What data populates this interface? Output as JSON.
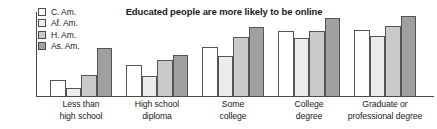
{
  "chart_data": {
    "type": "bar",
    "title": "Educated people are more likely to be online",
    "xlabel": "",
    "ylabel": "",
    "ylim": [
      0,
      80
    ],
    "yticks": [
      0,
      20,
      40,
      60,
      80
    ],
    "ytick_labels": [
      "0",
      "20",
      "40",
      "60",
      "80%"
    ],
    "grid": false,
    "legend_position": "top-left",
    "categories": [
      "Less than high school",
      "High school diploma",
      "Some college",
      "College degree",
      "Graduate or professional degree"
    ],
    "category_lines": [
      [
        "Less than",
        "high school"
      ],
      [
        "High school",
        "diploma"
      ],
      [
        "Some",
        "college"
      ],
      [
        "College",
        "degree"
      ],
      [
        "Graduate or",
        "professional degree"
      ]
    ],
    "series": [
      {
        "name": "C. Am.",
        "color": "#ffffff",
        "values": [
          15,
          30,
          47,
          62,
          63
        ]
      },
      {
        "name": "Af. Am.",
        "color": "#ececec",
        "values": [
          8,
          19,
          38,
          55,
          57
        ]
      },
      {
        "name": "H. Am.",
        "color": "#c9c9c9",
        "values": [
          20,
          34,
          56,
          62,
          67
        ]
      },
      {
        "name": "As. Am.",
        "color": "#a0a0a0",
        "values": [
          46,
          39,
          66,
          74,
          76
        ]
      }
    ]
  },
  "legend": {
    "items": [
      {
        "label": "C. Am."
      },
      {
        "label": "Af. Am."
      },
      {
        "label": "H. Am."
      },
      {
        "label": "As. Am."
      }
    ]
  },
  "axis": {
    "y_tick_80": "80%",
    "y_tick_60": "60",
    "y_tick_40": "40",
    "y_tick_20": "20",
    "y_tick_0": "0"
  }
}
